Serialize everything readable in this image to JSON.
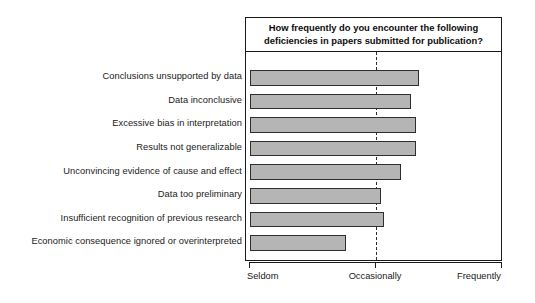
{
  "chart_data": {
    "type": "bar",
    "orientation": "horizontal",
    "title": "How frequently do you encounter the following deficiencies in papers submitted for publication?",
    "title_line1": "How frequently do you encounter the following",
    "title_line2": "deficiencies in papers submitted for publication?",
    "xlabel": "",
    "ylabel": "",
    "xlim": [
      0,
      100
    ],
    "grid": false,
    "legend": false,
    "bar_color": "#b5b5b5",
    "bar_border_color": "#2e2e2e",
    "axis_color": "#1a1a1a",
    "reference_line": {
      "value": 50,
      "style": "dashed",
      "label": "Occasionally"
    },
    "categories": [
      "Conclusions unsupported by data",
      "Data inconclusive",
      "Excessive bias in interpretation",
      "Results not generalizable",
      "Unconvincing evidence of cause and effect",
      "Data too preliminary",
      "Insufficient recognition of previous research",
      "Economic consequence ignored or overinterpreted"
    ],
    "values": [
      67,
      64,
      66,
      66,
      60,
      52,
      53,
      38
    ],
    "tick_labels": [
      "Seldom",
      "Occasionally",
      "Frequently"
    ],
    "tick_values": [
      0,
      50,
      100
    ]
  }
}
